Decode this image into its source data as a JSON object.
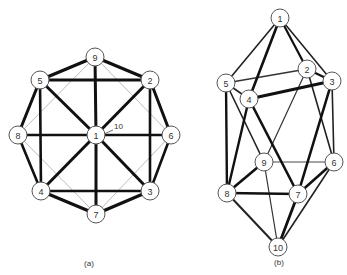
{
  "colors": {
    "edge_bold": "#111111",
    "edge_medium": "#222222",
    "edge_thin": "#333333",
    "edge_light": "#aaaaaa",
    "node_stroke": "#555555",
    "node_fill": "#ffffff",
    "text": "#333333"
  },
  "diagrams": [
    {
      "id": "a",
      "caption": "(a)",
      "caption_pos": [
        89,
        266
      ],
      "node_radius": 9,
      "nodes": [
        {
          "label": "1",
          "x": 96,
          "y": 135
        },
        {
          "label": "2",
          "x": 150,
          "y": 80
        },
        {
          "label": "3",
          "x": 150,
          "y": 191
        },
        {
          "label": "4",
          "x": 41,
          "y": 191
        },
        {
          "label": "5",
          "x": 40,
          "y": 80
        },
        {
          "label": "6",
          "x": 171,
          "y": 135
        },
        {
          "label": "7",
          "x": 96,
          "y": 214
        },
        {
          "label": "8",
          "x": 18,
          "y": 135
        },
        {
          "label": "9",
          "x": 95,
          "y": 57
        }
      ],
      "annotation": {
        "text": "10",
        "x": 114,
        "y": 129,
        "arrow_to": [
          104,
          134
        ]
      },
      "edges": [
        {
          "a": "9",
          "b": "5",
          "w": 3.2,
          "c": "bold"
        },
        {
          "a": "9",
          "b": "2",
          "w": 3.2,
          "c": "bold"
        },
        {
          "a": "5",
          "b": "2",
          "w": 3.0,
          "c": "bold"
        },
        {
          "a": "9",
          "b": "1",
          "w": 3.0,
          "c": "bold"
        },
        {
          "a": "5",
          "b": "8",
          "w": 3.0,
          "c": "bold"
        },
        {
          "a": "2",
          "b": "6",
          "w": 3.0,
          "c": "bold"
        },
        {
          "a": "5",
          "b": "4",
          "w": 2.6,
          "c": "bold"
        },
        {
          "a": "2",
          "b": "3",
          "w": 2.6,
          "c": "bold"
        },
        {
          "a": "5",
          "b": "1",
          "w": 3.0,
          "c": "bold"
        },
        {
          "a": "2",
          "b": "1",
          "w": 3.0,
          "c": "bold"
        },
        {
          "a": "4",
          "b": "1",
          "w": 3.0,
          "c": "bold"
        },
        {
          "a": "3",
          "b": "1",
          "w": 3.0,
          "c": "bold"
        },
        {
          "a": "8",
          "b": "1",
          "w": 2.6,
          "c": "bold"
        },
        {
          "a": "6",
          "b": "1",
          "w": 2.6,
          "c": "bold"
        },
        {
          "a": "1",
          "b": "7",
          "w": 3.0,
          "c": "bold"
        },
        {
          "a": "8",
          "b": "4",
          "w": 2.6,
          "c": "bold"
        },
        {
          "a": "6",
          "b": "3",
          "w": 2.6,
          "c": "bold"
        },
        {
          "a": "4",
          "b": "3",
          "w": 2.6,
          "c": "bold"
        },
        {
          "a": "4",
          "b": "7",
          "w": 3.2,
          "c": "bold"
        },
        {
          "a": "3",
          "b": "7",
          "w": 3.2,
          "c": "bold"
        },
        {
          "a": "9",
          "b": "8",
          "w": 0.8,
          "c": "light"
        },
        {
          "a": "9",
          "b": "6",
          "w": 0.8,
          "c": "light"
        },
        {
          "a": "8",
          "b": "7",
          "w": 0.8,
          "c": "light"
        },
        {
          "a": "6",
          "b": "7",
          "w": 0.8,
          "c": "light"
        }
      ]
    },
    {
      "id": "b",
      "caption": "(b)",
      "caption_pos": [
        279,
        265
      ],
      "node_radius": 9,
      "nodes": [
        {
          "label": "1",
          "x": 280,
          "y": 18
        },
        {
          "label": "2",
          "x": 307,
          "y": 69
        },
        {
          "label": "3",
          "x": 332,
          "y": 81
        },
        {
          "label": "4",
          "x": 249,
          "y": 99
        },
        {
          "label": "5",
          "x": 226,
          "y": 83
        },
        {
          "label": "6",
          "x": 334,
          "y": 162
        },
        {
          "label": "7",
          "x": 298,
          "y": 194
        },
        {
          "label": "8",
          "x": 227,
          "y": 193
        },
        {
          "label": "9",
          "x": 264,
          "y": 162
        },
        {
          "label": "10",
          "x": 278,
          "y": 247
        }
      ],
      "edges": [
        {
          "a": "1",
          "b": "5",
          "w": 1.6,
          "c": "medium"
        },
        {
          "a": "1",
          "b": "4",
          "w": 2.6,
          "c": "bold"
        },
        {
          "a": "1",
          "b": "2",
          "w": 2.2,
          "c": "bold"
        },
        {
          "a": "1",
          "b": "3",
          "w": 1.6,
          "c": "medium"
        },
        {
          "a": "5",
          "b": "2",
          "w": 1.4,
          "c": "thin"
        },
        {
          "a": "4",
          "b": "3",
          "w": 3.2,
          "c": "bold"
        },
        {
          "a": "2",
          "b": "3",
          "w": 2.2,
          "c": "bold"
        },
        {
          "a": "5",
          "b": "4",
          "w": 1.6,
          "c": "medium"
        },
        {
          "a": "5",
          "b": "8",
          "w": 2.4,
          "c": "bold"
        },
        {
          "a": "5",
          "b": "9",
          "w": 1.6,
          "c": "medium"
        },
        {
          "a": "4",
          "b": "8",
          "w": 2.4,
          "c": "bold"
        },
        {
          "a": "4",
          "b": "7",
          "w": 2.6,
          "c": "bold"
        },
        {
          "a": "2",
          "b": "9",
          "w": 1.2,
          "c": "thin"
        },
        {
          "a": "2",
          "b": "6",
          "w": 1.6,
          "c": "medium"
        },
        {
          "a": "3",
          "b": "6",
          "w": 1.6,
          "c": "medium"
        },
        {
          "a": "3",
          "b": "7",
          "w": 2.6,
          "c": "bold"
        },
        {
          "a": "9",
          "b": "6",
          "w": 0.9,
          "c": "thin"
        },
        {
          "a": "9",
          "b": "8",
          "w": 2.6,
          "c": "bold"
        },
        {
          "a": "9",
          "b": "10",
          "w": 1.2,
          "c": "thin"
        },
        {
          "a": "8",
          "b": "7",
          "w": 2.6,
          "c": "bold"
        },
        {
          "a": "8",
          "b": "10",
          "w": 2.0,
          "c": "medium"
        },
        {
          "a": "6",
          "b": "7",
          "w": 2.6,
          "c": "bold"
        },
        {
          "a": "6",
          "b": "10",
          "w": 1.6,
          "c": "medium"
        },
        {
          "a": "7",
          "b": "10",
          "w": 2.8,
          "c": "bold"
        }
      ]
    }
  ]
}
